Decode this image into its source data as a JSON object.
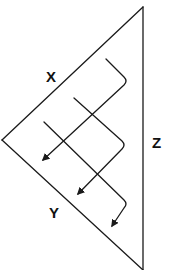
{
  "diagram": {
    "labels": {
      "x": "X",
      "y": "Y",
      "z": "Z"
    },
    "arrow_count": 3,
    "colors": {
      "line": "#1a1a1a",
      "background": "#ffffff"
    }
  }
}
